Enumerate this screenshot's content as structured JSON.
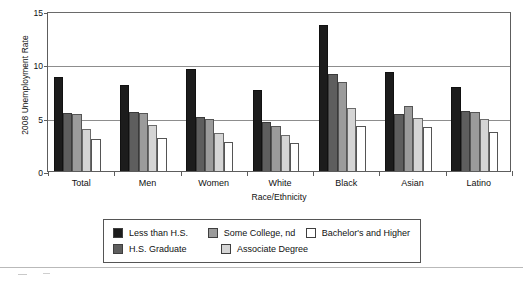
{
  "chart_data": {
    "type": "bar",
    "title": "",
    "xlabel": "Race/Ethnicity",
    "ylabel": "2008 Unemployment Rate",
    "categories": [
      "Total",
      "Men",
      "Women",
      "White",
      "Black",
      "Asian",
      "Latino"
    ],
    "ylim": [
      0,
      15
    ],
    "yticks": [
      0,
      5,
      10,
      15
    ],
    "ytick_labels": [
      "0",
      "5",
      "10",
      "15"
    ],
    "grid": true,
    "legend_position": "bottom",
    "series": [
      {
        "name": "Less than H.S.",
        "color": "#1c1c1c",
        "values": [
          8.8,
          8.1,
          9.6,
          7.6,
          13.7,
          9.3,
          7.9
        ]
      },
      {
        "name": "H.S. Graduate",
        "color": "#5e5e5e",
        "values": [
          5.4,
          5.5,
          5.1,
          4.6,
          9.1,
          5.3,
          5.6
        ]
      },
      {
        "name": "Some College, nd",
        "color": "#9b9b9b",
        "values": [
          5.3,
          5.4,
          4.9,
          4.2,
          8.3,
          6.1,
          5.5
        ]
      },
      {
        "name": "Associate Degree",
        "color": "#d5d5d5",
        "values": [
          3.9,
          4.3,
          3.6,
          3.4,
          5.9,
          5.0,
          4.9
        ]
      },
      {
        "name": "Bachelor's and Higher",
        "color": "#ffffff",
        "values": [
          3.0,
          3.1,
          2.7,
          2.6,
          4.2,
          4.1,
          3.7
        ]
      }
    ]
  },
  "legend": {
    "row1": [
      {
        "label": "Less than H.S.",
        "color": "#1c1c1c"
      },
      {
        "label": "Some College, nd",
        "color": "#9b9b9b"
      },
      {
        "label": "Bachelor's and Higher",
        "color": "#ffffff"
      }
    ],
    "row2": [
      {
        "label": "H.S. Graduate",
        "color": "#5e5e5e"
      },
      {
        "label": "Associate Degree",
        "color": "#d5d5d5"
      }
    ]
  }
}
